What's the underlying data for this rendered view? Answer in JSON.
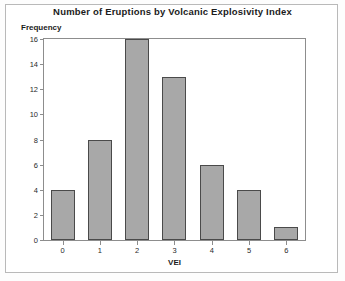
{
  "chart_data": {
    "type": "bar",
    "title": "Number of Eruptions by Volcanic Explosivity Index",
    "xlabel": "VEI",
    "ylabel": "Frequency",
    "categories": [
      "0",
      "1",
      "2",
      "3",
      "4",
      "5",
      "6"
    ],
    "values": [
      4,
      8,
      16,
      13,
      6,
      4,
      1
    ],
    "yticks": [
      "0",
      "2",
      "4",
      "6",
      "8",
      "10",
      "12",
      "14",
      "16"
    ],
    "ylim": [
      0,
      16
    ],
    "grid": false,
    "legend": null,
    "bar_color": "#a8a8a8",
    "bar_edge_color": "#4a4a4a",
    "plot_background": "#ffffff",
    "figure_background": "#fdfdfd"
  }
}
